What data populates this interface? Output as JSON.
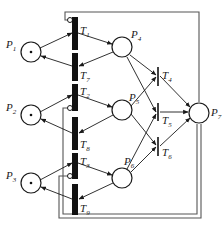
{
  "diagram": {
    "type": "petri-net",
    "colors": {
      "stroke": "#1a1a1a",
      "fill": "#ffffff",
      "bar": "#111111",
      "loop": "#555555"
    },
    "places": [
      {
        "id": "P1",
        "label": "P",
        "sub": "1",
        "token": true
      },
      {
        "id": "P2",
        "label": "P",
        "sub": "2",
        "token": true
      },
      {
        "id": "P3",
        "label": "P",
        "sub": "3",
        "token": true
      },
      {
        "id": "P4",
        "label": "P",
        "sub": "4",
        "token": false
      },
      {
        "id": "P5",
        "label": "P",
        "sub": "5",
        "token": false
      },
      {
        "id": "P6",
        "label": "P",
        "sub": "6",
        "token": false
      },
      {
        "id": "P7",
        "label": "P",
        "sub": "7",
        "token": false
      }
    ],
    "transitions": [
      {
        "id": "T1",
        "label": "T",
        "sub": "1"
      },
      {
        "id": "T7",
        "label": "T",
        "sub": "7"
      },
      {
        "id": "T2",
        "label": "T",
        "sub": "2"
      },
      {
        "id": "T8",
        "label": "T",
        "sub": "8"
      },
      {
        "id": "T3",
        "label": "T",
        "sub": "3"
      },
      {
        "id": "T9",
        "label": "T",
        "sub": "9"
      },
      {
        "id": "T4",
        "label": "T",
        "sub": "4"
      },
      {
        "id": "T5",
        "label": "T",
        "sub": "5"
      },
      {
        "id": "T6",
        "label": "T",
        "sub": "6"
      }
    ]
  }
}
